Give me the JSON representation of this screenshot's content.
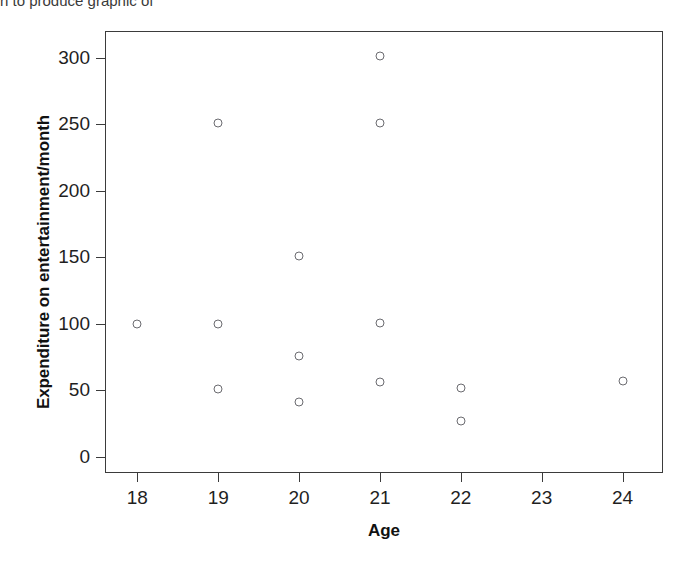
{
  "page": {
    "top_text_fragment": "n to produce graphic of",
    "bottom_text_fragment": ""
  },
  "chart_data": {
    "type": "scatter",
    "title": "",
    "xlabel": "Age",
    "ylabel": "Expenditure on entertainment/month",
    "xlim": [
      17.6,
      24.5
    ],
    "ylim": [
      -12,
      320
    ],
    "xticks": [
      18,
      19,
      20,
      21,
      22,
      23,
      24
    ],
    "xtick_labels": [
      "18",
      "19",
      "20",
      "21",
      "22",
      "23",
      "24"
    ],
    "yticks": [
      0,
      50,
      100,
      150,
      200,
      250,
      300
    ],
    "ytick_labels": [
      "0",
      "50",
      "100",
      "150",
      "200",
      "250",
      "300"
    ],
    "grid": false,
    "legend": null,
    "marker": {
      "shape": "open-circle",
      "color": "#6b6b70",
      "size": 9
    },
    "points": [
      {
        "x": 18,
        "y": 100
      },
      {
        "x": 19,
        "y": 251
      },
      {
        "x": 19,
        "y": 100
      },
      {
        "x": 19,
        "y": 51
      },
      {
        "x": 20,
        "y": 151
      },
      {
        "x": 20,
        "y": 76
      },
      {
        "x": 20,
        "y": 41
      },
      {
        "x": 21,
        "y": 301
      },
      {
        "x": 21,
        "y": 251
      },
      {
        "x": 21,
        "y": 101
      },
      {
        "x": 21,
        "y": 56
      },
      {
        "x": 22,
        "y": 52
      },
      {
        "x": 22,
        "y": 27
      },
      {
        "x": 24,
        "y": 57
      }
    ]
  }
}
